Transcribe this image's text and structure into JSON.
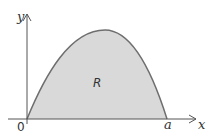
{
  "diagram": {
    "region_label": "R",
    "origin_label": "0",
    "x_axis_label": "x",
    "y_axis_label": "y",
    "root_label": "a",
    "colors": {
      "fill": "#d9d9d9",
      "curve": "#6e6e6e",
      "axis": "#555555",
      "text": "#333333"
    }
  }
}
